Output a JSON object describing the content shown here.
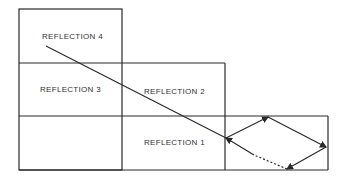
{
  "diagram": {
    "labels": {
      "reflection_4": "REFLECTION 4",
      "reflection_3": "REFLECTION 3",
      "reflection_2": "REFLECTION 2",
      "reflection_1": "REFLECTION 1"
    },
    "colors": {
      "line": "#2a2a2a",
      "background": "#ffffff"
    }
  }
}
